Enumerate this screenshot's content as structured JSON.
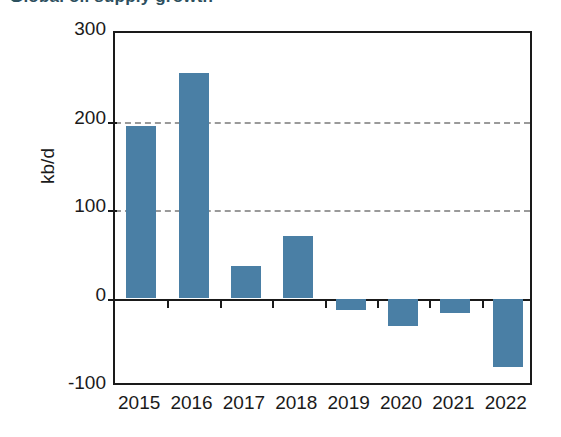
{
  "title": {
    "text": "Global oil supply growth",
    "bullet": "bullet-marker",
    "accent_color": "#2d4f5e"
  },
  "chart_data": {
    "type": "bar",
    "title": "",
    "xlabel": "",
    "ylabel": "kb/d",
    "categories": [
      "2015",
      "2016",
      "2017",
      "2018",
      "2019",
      "2020",
      "2021",
      "2022"
    ],
    "values": [
      195,
      255,
      37,
      71,
      -13,
      -31,
      -16,
      -77
    ],
    "ylim": [
      -100,
      300
    ],
    "yticks": [
      300,
      200,
      100,
      0,
      -100
    ],
    "ytick_labels": [
      "300",
      "200",
      "100",
      "0",
      "-100"
    ],
    "gridlines": [
      200,
      100
    ],
    "grid": true,
    "legend": "none",
    "bar_color": "#4a7fa5",
    "axis_color": "#1a1a1a",
    "grid_color": "#9a9a9a"
  }
}
